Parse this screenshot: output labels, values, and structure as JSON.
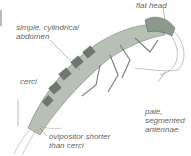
{
  "figure": {
    "labels": {
      "flat_head": "flat head",
      "abdomen": "simple, cylindrical\nabdomen",
      "cerci": "cerci",
      "antennae": "pale,\nsegmented\nantennae",
      "ovipositor": "ovipositor shorter\nthan cerci"
    }
  }
}
